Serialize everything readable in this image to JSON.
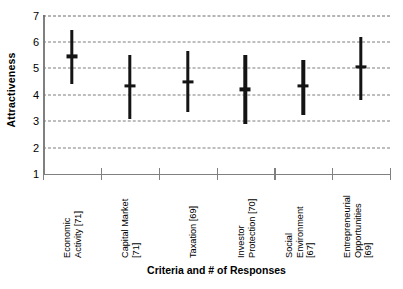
{
  "chart_data": {
    "type": "bar",
    "title": "",
    "subtitle": "",
    "xlabel": "Criteria and # of Responses",
    "ylabel": "Attractiveness",
    "ylim": [
      1,
      7
    ],
    "yticks": [
      1,
      2,
      3,
      4,
      5,
      6,
      7
    ],
    "ytick_labels": [
      "1",
      "2",
      "3",
      "4",
      "5",
      "6",
      "7"
    ],
    "grid": true,
    "grid_style": "dashed horizontal",
    "legend": null,
    "legend_position": "none",
    "marker_description": "vertical range bar with horizontal mean tick",
    "categories": [
      "Economic Activity [71]",
      "Capital Market [71]",
      "Taxation [69]",
      "Investor Protection [70]",
      "Social Environment [67]",
      "Entrepreneurial Opportunities [69]"
    ],
    "category_lines": [
      [
        "Economic",
        "Activity [71]"
      ],
      [
        "Capital Market",
        "[71]"
      ],
      [
        "Taxation [69]"
      ],
      [
        "Investor",
        "Protection [70]"
      ],
      [
        "Social",
        "Environment",
        "[67]"
      ],
      [
        "Entrepreneurial",
        "Opportunities",
        "[69]"
      ]
    ],
    "response_counts": [
      71,
      71,
      69,
      70,
      67,
      69
    ],
    "values": [
      5.45,
      4.35,
      4.5,
      4.2,
      4.35,
      5.05
    ],
    "series": [
      {
        "name": "Mean",
        "values": [
          5.45,
          4.35,
          4.5,
          4.2,
          4.35,
          5.05
        ]
      },
      {
        "name": "Range High",
        "values": [
          6.45,
          5.5,
          5.65,
          5.5,
          5.3,
          6.2
        ]
      },
      {
        "name": "Range Low",
        "values": [
          4.4,
          3.1,
          3.35,
          2.9,
          3.25,
          3.8
        ]
      }
    ],
    "points": [
      {
        "category": "Economic Activity [71]",
        "mean": 5.45,
        "high": 6.45,
        "low": 4.4
      },
      {
        "category": "Capital Market [71]",
        "mean": 4.35,
        "high": 5.5,
        "low": 3.1
      },
      {
        "category": "Taxation [69]",
        "mean": 4.5,
        "high": 5.65,
        "low": 3.35
      },
      {
        "category": "Investor Protection [70]",
        "mean": 4.2,
        "high": 5.5,
        "low": 2.9
      },
      {
        "category": "Social Environment [67]",
        "mean": 4.35,
        "high": 5.3,
        "low": 3.25
      },
      {
        "category": "Entrepreneurial Opportunities [69]",
        "mean": 5.05,
        "high": 6.2,
        "low": 3.8
      }
    ]
  },
  "colors": {
    "background": "#ffffff",
    "mark": "#141414",
    "axis": "#808080",
    "grid": "#7c7c7c",
    "text": "#000000"
  }
}
